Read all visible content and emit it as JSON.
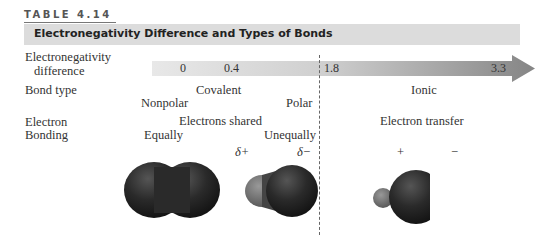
{
  "table": {
    "number": "TABLE 4.14",
    "title": "Electronegativity Difference and Types of Bonds"
  },
  "rows": {
    "en_difference": {
      "label_line1": "Electronegativity",
      "label_line2": "difference"
    },
    "bond_type": {
      "label": "Bond type"
    },
    "electron": {
      "label": "Electron"
    },
    "bonding": {
      "label": "Bonding"
    }
  },
  "scale": {
    "ticks": [
      "0",
      "0.4",
      "1.8",
      "3.3"
    ]
  },
  "bond_types": {
    "covalent": "Covalent",
    "nonpolar": "Nonpolar",
    "polar": "Polar",
    "ionic": "Ionic"
  },
  "electron_behavior": {
    "shared": "Electrons shared",
    "transfer": "Electron transfer",
    "equally": "Equally",
    "unequally": "Unequally"
  },
  "charges": {
    "delta_plus": "δ+",
    "delta_minus": "δ−",
    "plus": "+",
    "minus": "−"
  },
  "colors": {
    "arrow_light": "#e6e6e6",
    "arrow_dark": "#8a8a8a",
    "title_bar": "#dcdcdc"
  }
}
